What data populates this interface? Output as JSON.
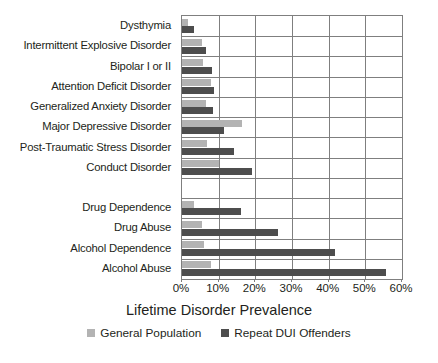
{
  "chart_data": {
    "type": "bar",
    "orientation": "horizontal",
    "title": "",
    "xlabel": "Lifetime Disorder Prevalence",
    "ylabel": "",
    "xlim": [
      0,
      60
    ],
    "xticks": [
      0,
      10,
      20,
      30,
      40,
      50,
      60
    ],
    "xticklabels": [
      "0%",
      "10%",
      "20%",
      "30%",
      "40%",
      "50%",
      "60%"
    ],
    "grid": true,
    "grid_axis": "both",
    "legend_position": "bottom",
    "categories": [
      "Dysthymia",
      "Intermittent Explosive Disorder",
      "Bipolar I or II",
      "Attention Deficit Disorder",
      "Generalized Anxiety Disorder",
      "Major Depressive Disorder",
      "Post-Traumatic Stress Disorder",
      "Conduct Disorder",
      "",
      "Drug Dependence",
      "Drug Abuse",
      "Alcohol Dependence",
      "Alcohol Abuse"
    ],
    "series": [
      {
        "name": "General Population",
        "color": "#b3b3b3",
        "values": [
          1.7,
          5.4,
          5.7,
          7.8,
          6.5,
          16.4,
          6.9,
          10.1,
          null,
          3.3,
          5.4,
          5.9,
          8.0
        ]
      },
      {
        "name": "Repeat DUI Offenders",
        "color": "#4d4d4d",
        "values": [
          3.3,
          6.5,
          8.1,
          8.7,
          8.5,
          11.4,
          14.2,
          19.0,
          null,
          16.0,
          26.1,
          41.8,
          55.6
        ]
      }
    ]
  },
  "legend": {
    "items": [
      {
        "label": "General Population",
        "swatch": "light"
      },
      {
        "label": "Repeat DUI Offenders",
        "swatch": "dark"
      }
    ]
  }
}
